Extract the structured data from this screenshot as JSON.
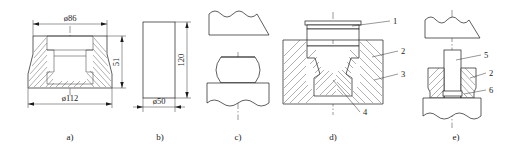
{
  "figure": {
    "type": "engineering-drawing",
    "background": "#ffffff",
    "line_color": "#1a1a1a",
    "panels": [
      {
        "key": "a",
        "caption": "a)",
        "description": "sectioned flanged hollow forging part",
        "dimensions": [
          {
            "name": "top-diameter",
            "text": "ø86",
            "orientation": "horizontal"
          },
          {
            "name": "bottom-diameter",
            "text": "ø112",
            "orientation": "horizontal"
          },
          {
            "name": "height",
            "text": "51",
            "orientation": "vertical"
          }
        ]
      },
      {
        "key": "b",
        "caption": "b)",
        "description": "cylindrical billet blank",
        "dimensions": [
          {
            "name": "billet-diameter",
            "text": "ø50",
            "orientation": "horizontal"
          },
          {
            "name": "billet-height",
            "text": "120",
            "orientation": "vertical"
          }
        ]
      },
      {
        "key": "c",
        "caption": "c)",
        "description": "upsetting of billet between flat dies",
        "dimensions": []
      },
      {
        "key": "d",
        "caption": "d)",
        "description": "closed die forging in cavity",
        "dimensions": [],
        "callouts": [
          "1",
          "2",
          "3",
          "4"
        ]
      },
      {
        "key": "e",
        "caption": "e)",
        "description": "piercing punch operation",
        "dimensions": [],
        "callouts": [
          "5",
          "2",
          "6"
        ]
      }
    ]
  }
}
